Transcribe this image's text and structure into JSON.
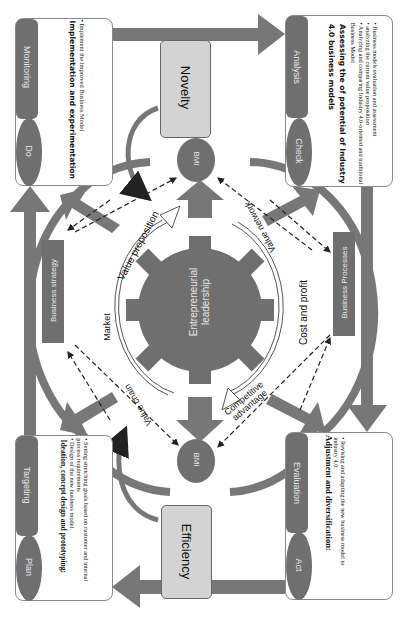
{
  "diagram": {
    "orientation": "rotated 90 degrees clockwise",
    "colors": {
      "dark_fill": "#6f6f6f",
      "light_box": "#d3d3d3",
      "arrow": "#777777",
      "outline": "#8a8a8a"
    }
  },
  "cards": {
    "do": {
      "oval": "Do",
      "bar": "Monitoring",
      "title": "Implementation and experimentation",
      "bullets": [
        "Implement the improved Business Model"
      ]
    },
    "check": {
      "oval": "Check",
      "bar": "Analysis",
      "title": "Assessing the of potential of Industry 4.0 business models",
      "bullets": [
        "Business models evaluation and assessment",
        "analyzing the current value proposition",
        "Analyzing and comparing Industry 4.0-oriented and traditional Business Model"
      ]
    },
    "plan": {
      "oval": "Plan",
      "bar": "Targeting",
      "title": "Ideation, concept design and prototyping:",
      "bullets": [
        "Setting stretching goals based on customer and internal process requirements",
        "Design of the new business model."
      ]
    },
    "act": {
      "oval": "Act",
      "bar": "Evaluation",
      "title": "Adjustment and diversification:",
      "bullets": [
        "Revising and adapting the new business model to industry 4.0."
      ]
    }
  },
  "center": {
    "novelty": "Novelty",
    "efficiency": "Efficiency",
    "bmi_top": "BMI",
    "bmi_bottom": "BMI",
    "gear": "Entrepreneurial leadership",
    "business_strategy": "Business strategy",
    "business_processes": "Business Processes"
  },
  "ring_labels": {
    "value_proposition": "Value proposition",
    "value_network": "Value network",
    "market": "Market",
    "cost_and_profit": "Cost and profit",
    "value_chain": "Value chain",
    "competitive_advantage": "Competitive advantage"
  }
}
